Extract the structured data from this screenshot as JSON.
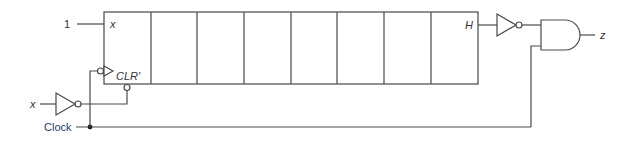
{
  "diagram": {
    "register": {
      "cells": 8,
      "first_input_label": "x",
      "constant_input": "1",
      "clear_label": "CLR'",
      "last_output_label": "H"
    },
    "inputs": {
      "x_label": "x",
      "clock_label": "Clock"
    },
    "output": {
      "z_label": "z"
    },
    "gates": [
      {
        "type": "inverter",
        "input": "x",
        "output": "CLR'"
      },
      {
        "type": "inverter",
        "input": "H",
        "output": "AND input 1"
      },
      {
        "type": "and",
        "inputs": [
          "H'",
          "Clock"
        ],
        "output": "z"
      }
    ],
    "colors": {
      "wire": "#4a4a4a",
      "clock_label": "#1f3a6b"
    }
  }
}
